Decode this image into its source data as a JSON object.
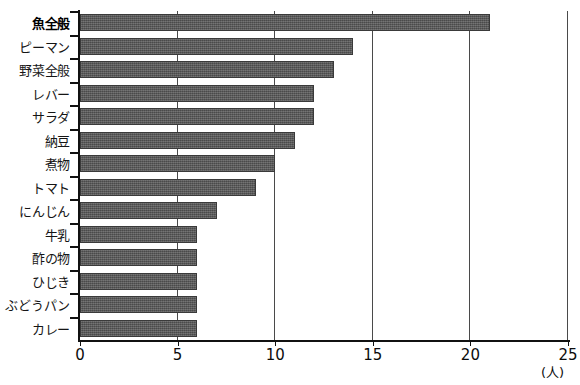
{
  "chart_data": {
    "type": "bar",
    "orientation": "horizontal",
    "title": "",
    "xlabel": "(人)",
    "ylabel": "",
    "xlim": [
      0,
      25
    ],
    "xticks": [
      "0",
      "5",
      "10",
      "15",
      "20",
      "25"
    ],
    "xtick_values": [
      0,
      5,
      10,
      15,
      20,
      25
    ],
    "grid": "vertical",
    "legend": "none",
    "categories": [
      "魚全般",
      "ピーマン",
      "野菜全般",
      "レバー",
      "サラダ",
      "納豆",
      "煮物",
      "トマト",
      "にんじん",
      "牛乳",
      "酢の物",
      "ひじき",
      "ぶどうパン",
      "カレー"
    ],
    "values": [
      21,
      14,
      13,
      12,
      12,
      11,
      10,
      9,
      7,
      6,
      6,
      6,
      6,
      6
    ],
    "emphasis_index": 0,
    "bar_color": "#585858",
    "axis_color": "#111111",
    "grid_color": "#4a4a4a",
    "background_color": "#ffffff"
  }
}
